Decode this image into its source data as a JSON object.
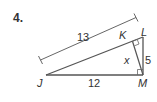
{
  "problem": {
    "number": "4."
  },
  "diagram": {
    "type": "right-triangle-with-altitude",
    "vertices": {
      "J": "J",
      "K": "K",
      "L": "L",
      "M": "M"
    },
    "labels": {
      "JL_length": "13",
      "JM_length": "12",
      "LM_length": "5",
      "KM_unknown": "x"
    },
    "colors": {
      "stroke": "#555555",
      "text": "#333333"
    }
  }
}
